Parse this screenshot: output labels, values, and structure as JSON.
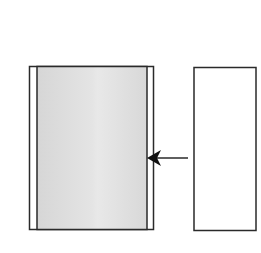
{
  "diagram": {
    "background": "#ffffff",
    "stroke_color": "#2a2a2a",
    "fill_gray": "#dcdcdc",
    "fill_gray_light": "#e6e6e6",
    "left_block": {
      "label": "",
      "outer": {
        "x": 29,
        "y": 66,
        "w": 125,
        "h": 163
      },
      "inner_shaded": {
        "x": 37,
        "y": 66,
        "w": 110,
        "h": 163
      }
    },
    "right_block": {
      "label": "",
      "rect": {
        "x": 194,
        "y": 67,
        "w": 62,
        "h": 163
      }
    },
    "arrow": {
      "direction": "left",
      "tip": {
        "x": 147,
        "y": 158
      },
      "tail": {
        "x": 188,
        "y": 158
      }
    }
  }
}
